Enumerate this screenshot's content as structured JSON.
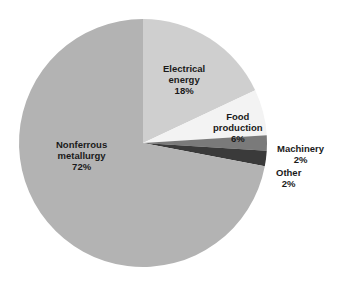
{
  "chart_data": {
    "type": "pie",
    "title": "",
    "categories": [
      "Electrical energy",
      "Food production",
      "Machinery",
      "Other",
      "Nonferrous metallurgy"
    ],
    "values": [
      18,
      6,
      2,
      2,
      72
    ],
    "units": "%",
    "colors": [
      "#cfcfcf",
      "#f3f3f3",
      "#7a7a7a",
      "#3a3a3a",
      "#b3b3b3"
    ],
    "start_angle": "12 o'clock",
    "direction": "clockwise",
    "legend": "none (direct labels)"
  },
  "labels": {
    "electrical": {
      "line1": "Electrical",
      "line2": "energy",
      "pct": "18%"
    },
    "food": {
      "line1": "Food",
      "line2": "production",
      "pct": "6%"
    },
    "machinery": {
      "line1": "Machinery",
      "pct": "2%"
    },
    "other": {
      "line1": "Other",
      "pct": "2%"
    },
    "nonferrous": {
      "line1": "Nonferrous",
      "line2": "metallurgy",
      "pct": "72%"
    }
  }
}
